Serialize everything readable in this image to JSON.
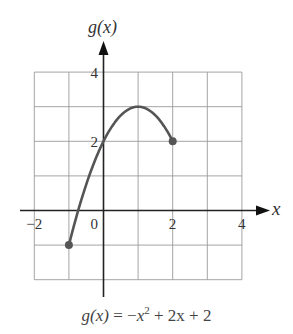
{
  "chart_data": {
    "type": "line",
    "title": "",
    "xlabel": "x",
    "ylabel": "g(x)",
    "xlim": [
      -2,
      4
    ],
    "ylim": [
      -2,
      4
    ],
    "grid": true,
    "x_ticks": [
      -2,
      0,
      2,
      4
    ],
    "x_tick_labels": [
      "−2",
      "0",
      "2",
      "4"
    ],
    "y_ticks": [
      2,
      4
    ],
    "y_tick_labels": [
      "2",
      "4"
    ],
    "series": [
      {
        "name": "g(x) = −x² + 2x + 2",
        "function": "-x^2 + 2x + 2",
        "domain": [
          -1,
          2
        ],
        "x": [
          -1,
          -0.5,
          0,
          0.5,
          1,
          1.5,
          2
        ],
        "values": [
          -1,
          0.75,
          2,
          2.75,
          3,
          2.75,
          2
        ],
        "endpoints": [
          {
            "x": -1,
            "y": -1,
            "closed": true
          },
          {
            "x": 2,
            "y": 2,
            "closed": true
          }
        ],
        "color": "#555555"
      }
    ],
    "caption": {
      "lhs": "g(x)",
      "eq": " = −",
      "term1_base": "x",
      "term1_exp": "2",
      "rest": " + 2x + 2"
    }
  }
}
